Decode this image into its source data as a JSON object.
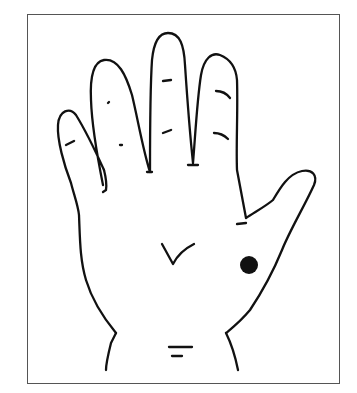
{
  "figure": {
    "marker": {
      "shape": "filled-circle",
      "color": "#111111"
    },
    "line_color": "#111111",
    "frame_color": "#555555"
  }
}
